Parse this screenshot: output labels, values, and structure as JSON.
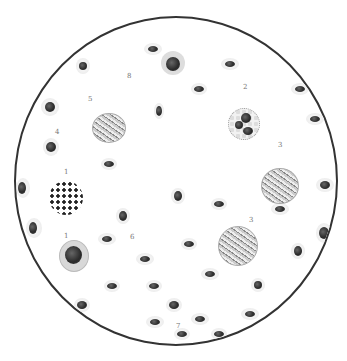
{
  "figure": {
    "labels": [
      {
        "id": "8",
        "text": "8",
        "x": 127,
        "y": 77
      },
      {
        "id": "5",
        "text": "5",
        "x": 88,
        "y": 100
      },
      {
        "id": "2",
        "text": "2",
        "x": 243,
        "y": 88
      },
      {
        "id": "4",
        "text": "4",
        "x": 55,
        "y": 133
      },
      {
        "id": "1a",
        "text": "1",
        "x": 64,
        "y": 173
      },
      {
        "id": "3a",
        "text": "3",
        "x": 278,
        "y": 146
      },
      {
        "id": "1b",
        "text": "1",
        "x": 64,
        "y": 237
      },
      {
        "id": "3b",
        "text": "3",
        "x": 249,
        "y": 221
      },
      {
        "id": "6",
        "text": "6",
        "x": 130,
        "y": 238
      },
      {
        "id": "7",
        "text": "7",
        "x": 176,
        "y": 327
      }
    ]
  }
}
